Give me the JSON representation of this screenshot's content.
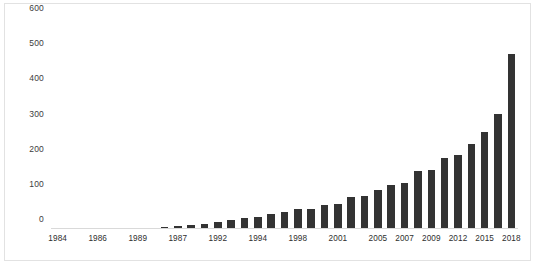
{
  "chart_data": {
    "type": "bar",
    "title": "",
    "xlabel": "",
    "ylabel": "",
    "ylim": [
      0,
      600
    ],
    "grid": false,
    "legend": null,
    "bar_color": "#333333",
    "yticks": [
      600,
      500,
      400,
      300,
      200,
      100,
      0
    ],
    "categories": [
      "1984",
      "1985",
      "1986",
      "1987",
      "1988",
      "1989",
      "1990",
      "1991",
      "1992",
      "1993",
      "1994",
      "1995",
      "1996",
      "1997",
      "1998",
      "1999",
      "2000",
      "2001",
      "2002",
      "2003",
      "2004",
      "2005",
      "2006",
      "2007",
      "2008",
      "2009",
      "2010",
      "2011",
      "2012",
      "2013",
      "2014",
      "2015",
      "2016",
      "2017",
      "2018"
    ],
    "visible_tick_labels": [
      "1984",
      "1986",
      "1989",
      "1987",
      "1992",
      "1994",
      "1998",
      "2001",
      "2005",
      "2007",
      "2009",
      "2012",
      "2015",
      "2018"
    ],
    "tick_label_positions": [
      0,
      3,
      6,
      9,
      12,
      15,
      18,
      21,
      24,
      26,
      28,
      30,
      32,
      34
    ],
    "values": [
      1,
      1,
      1,
      2,
      2,
      2,
      3,
      4,
      6,
      8,
      11,
      15,
      19,
      25,
      32,
      34,
      44,
      49,
      57,
      58,
      68,
      70,
      92,
      94,
      111,
      125,
      132,
      165,
      168,
      202,
      210,
      242,
      276,
      328,
      497
    ],
    "values_tail": [
      361,
      384,
      386,
      497
    ],
    "max_value": 497,
    "min_value": 1,
    "n_bars": 35
  },
  "xaxis_labels": [
    {
      "index": 0,
      "text": "1984"
    },
    {
      "index": 3,
      "text": "1986"
    },
    {
      "index": 6,
      "text": "1989"
    },
    {
      "index": 9,
      "text": "1987"
    },
    {
      "index": 12,
      "text": "1992"
    },
    {
      "index": 15,
      "text": "1994"
    },
    {
      "index": 18,
      "text": "1998"
    },
    {
      "index": 21,
      "text": "2001"
    },
    {
      "index": 24,
      "text": "2005"
    },
    {
      "index": 26,
      "text": "2007"
    },
    {
      "index": 28,
      "text": "2009"
    },
    {
      "index": 30,
      "text": "2012"
    },
    {
      "index": 32,
      "text": "2015"
    },
    {
      "index": 34,
      "text": "2018"
    }
  ],
  "caption": ""
}
